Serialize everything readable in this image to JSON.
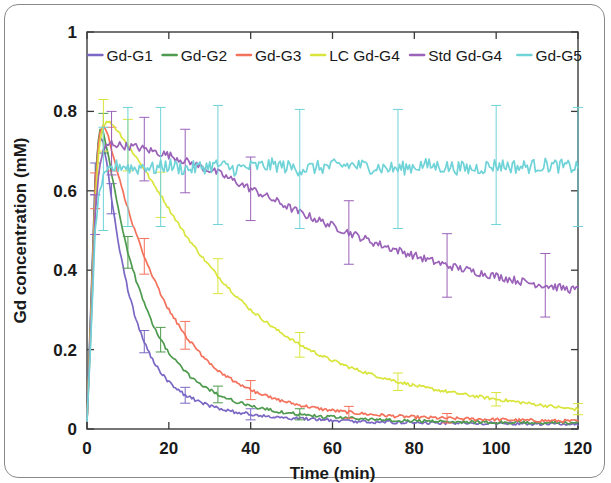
{
  "figure": {
    "background_color": "#ffffff",
    "border_color": "#8a8a8a"
  },
  "axes": {
    "x_label": "Time (min)",
    "y_label": "Gd concentration (mM)",
    "x_ticks": [
      "0",
      "20",
      "40",
      "60",
      "80",
      "100",
      "120"
    ],
    "y_ticks": [
      "0",
      "0.2",
      "0.4",
      "0.6",
      "0.8",
      "1"
    ],
    "x_lim": [
      0,
      120
    ],
    "y_lim": [
      0,
      1
    ],
    "tick_direction": "in",
    "box": true
  },
  "legend": {
    "position": "top-inside",
    "orientation": "horizontal",
    "entries": [
      {
        "label": "Gd-G1",
        "color": "#7b68c4"
      },
      {
        "label": "Gd-G2",
        "color": "#4e9a4e"
      },
      {
        "label": "Gd-G3",
        "color": "#f4715c"
      },
      {
        "label": "LC Gd-G4",
        "color": "#d9e53d"
      },
      {
        "label": "Std Gd-G4",
        "color": "#9a62b8"
      },
      {
        "label": "Gd-G5",
        "color": "#6fd3d8"
      }
    ]
  },
  "chart_data": {
    "type": "line",
    "title": "",
    "xlabel": "Time (min)",
    "ylabel": "Gd concentration (mM)",
    "xlim": [
      0,
      120
    ],
    "ylim": [
      0,
      1
    ],
    "grid": false,
    "legend_position": "top-inside",
    "error_bars": true,
    "x_unit": "min",
    "y_unit": "mM",
    "series": [
      {
        "name": "Gd-G1",
        "color": "#7b68c4",
        "peak_value": 0.74,
        "peak_time": 3,
        "final_value": 0.012,
        "decay_halflife_min": 5.5,
        "error_bar_magnitude": 0.035,
        "x": [
          0,
          1,
          2,
          3,
          4,
          5,
          6,
          8,
          10,
          12,
          14,
          16,
          18,
          20,
          24,
          28,
          32,
          36,
          40,
          46,
          52,
          58,
          64,
          70,
          76,
          82,
          88,
          94,
          100,
          106,
          112,
          118,
          120
        ],
        "y": [
          0.02,
          0.33,
          0.63,
          0.74,
          0.72,
          0.66,
          0.58,
          0.45,
          0.35,
          0.275,
          0.22,
          0.175,
          0.143,
          0.118,
          0.085,
          0.066,
          0.052,
          0.043,
          0.037,
          0.03,
          0.026,
          0.023,
          0.02,
          0.018,
          0.017,
          0.016,
          0.015,
          0.014,
          0.014,
          0.013,
          0.013,
          0.012,
          0.012
        ],
        "yerr": [
          0.01,
          0.03,
          0.04,
          0.045,
          0.045,
          0.04,
          0.038,
          0.035,
          0.032,
          0.03,
          0.028,
          0.026,
          0.024,
          0.022,
          0.02,
          0.018,
          0.016,
          0.015,
          0.014,
          0.013,
          0.012,
          0.011,
          0.01,
          0.01,
          0.009,
          0.009,
          0.008,
          0.008,
          0.008,
          0.007,
          0.007,
          0.007,
          0.007
        ]
      },
      {
        "name": "Gd-G2",
        "color": "#4e9a4e",
        "peak_value": 0.755,
        "peak_time": 3.5,
        "final_value": 0.015,
        "decay_halflife_min": 7.5,
        "error_bar_magnitude": 0.04,
        "x": [
          0,
          1,
          2,
          3,
          4,
          5,
          6,
          8,
          10,
          12,
          14,
          16,
          18,
          20,
          24,
          28,
          32,
          36,
          40,
          46,
          52,
          58,
          64,
          70,
          76,
          82,
          88,
          94,
          100,
          106,
          112,
          118,
          120
        ],
        "y": [
          0.02,
          0.31,
          0.62,
          0.755,
          0.745,
          0.7,
          0.645,
          0.535,
          0.445,
          0.375,
          0.315,
          0.265,
          0.225,
          0.192,
          0.143,
          0.11,
          0.087,
          0.07,
          0.058,
          0.045,
          0.037,
          0.031,
          0.027,
          0.024,
          0.022,
          0.02,
          0.019,
          0.018,
          0.017,
          0.016,
          0.016,
          0.015,
          0.015
        ],
        "yerr": [
          0.01,
          0.03,
          0.045,
          0.05,
          0.05,
          0.048,
          0.045,
          0.042,
          0.04,
          0.038,
          0.035,
          0.033,
          0.031,
          0.029,
          0.026,
          0.023,
          0.021,
          0.019,
          0.017,
          0.016,
          0.014,
          0.013,
          0.012,
          0.011,
          0.011,
          0.01,
          0.01,
          0.009,
          0.009,
          0.009,
          0.008,
          0.008,
          0.008
        ]
      },
      {
        "name": "Gd-G3",
        "color": "#f4715c",
        "peak_value": 0.765,
        "peak_time": 4,
        "final_value": 0.02,
        "decay_halflife_min": 11,
        "error_bar_magnitude": 0.045,
        "x": [
          0,
          1,
          2,
          3,
          4,
          5,
          6,
          8,
          10,
          12,
          14,
          16,
          18,
          20,
          24,
          28,
          32,
          36,
          40,
          46,
          52,
          58,
          64,
          70,
          76,
          82,
          88,
          94,
          100,
          106,
          112,
          118,
          120
        ],
        "y": [
          0.02,
          0.29,
          0.6,
          0.745,
          0.765,
          0.745,
          0.705,
          0.625,
          0.555,
          0.49,
          0.435,
          0.385,
          0.34,
          0.3,
          0.236,
          0.186,
          0.148,
          0.12,
          0.098,
          0.075,
          0.06,
          0.049,
          0.042,
          0.036,
          0.032,
          0.029,
          0.027,
          0.025,
          0.024,
          0.022,
          0.021,
          0.02,
          0.02
        ],
        "yerr": [
          0.01,
          0.03,
          0.045,
          0.055,
          0.058,
          0.058,
          0.055,
          0.052,
          0.05,
          0.048,
          0.045,
          0.043,
          0.041,
          0.039,
          0.035,
          0.032,
          0.029,
          0.026,
          0.024,
          0.021,
          0.019,
          0.017,
          0.015,
          0.014,
          0.013,
          0.012,
          0.012,
          0.011,
          0.011,
          0.01,
          0.01,
          0.01,
          0.01
        ]
      },
      {
        "name": "LC Gd-G4",
        "color": "#d9e53d",
        "peak_value": 0.775,
        "peak_time": 5,
        "final_value": 0.05,
        "decay_halflife_min": 26,
        "error_bar_magnitude": 0.06,
        "x": [
          0,
          1,
          2,
          3,
          4,
          5,
          6,
          8,
          10,
          12,
          14,
          16,
          18,
          20,
          24,
          28,
          32,
          36,
          40,
          46,
          52,
          58,
          64,
          70,
          76,
          82,
          88,
          94,
          100,
          106,
          112,
          118,
          120
        ],
        "y": [
          0.02,
          0.27,
          0.57,
          0.72,
          0.765,
          0.775,
          0.77,
          0.745,
          0.715,
          0.685,
          0.655,
          0.62,
          0.59,
          0.555,
          0.49,
          0.435,
          0.385,
          0.34,
          0.3,
          0.252,
          0.212,
          0.181,
          0.156,
          0.136,
          0.119,
          0.105,
          0.094,
          0.084,
          0.075,
          0.067,
          0.059,
          0.051,
          0.05
        ],
        "yerr": [
          0.01,
          0.03,
          0.05,
          0.06,
          0.065,
          0.068,
          0.068,
          0.067,
          0.065,
          0.063,
          0.061,
          0.059,
          0.057,
          0.055,
          0.051,
          0.047,
          0.044,
          0.041,
          0.038,
          0.034,
          0.031,
          0.028,
          0.026,
          0.024,
          0.022,
          0.021,
          0.019,
          0.018,
          0.017,
          0.016,
          0.015,
          0.014,
          0.014
        ]
      },
      {
        "name": "Std Gd-G4",
        "color": "#9a62b8",
        "peak_value": 0.72,
        "peak_time": 6,
        "final_value": 0.35,
        "decay_halflife_min": 110,
        "error_bar_magnitude": 0.08,
        "x": [
          0,
          1,
          2,
          3,
          4,
          5,
          6,
          8,
          10,
          12,
          14,
          16,
          18,
          20,
          24,
          28,
          32,
          36,
          40,
          46,
          52,
          58,
          64,
          70,
          76,
          82,
          88,
          94,
          100,
          106,
          112,
          118,
          120
        ],
        "y": [
          0.02,
          0.26,
          0.54,
          0.66,
          0.7,
          0.715,
          0.72,
          0.715,
          0.712,
          0.71,
          0.705,
          0.7,
          0.695,
          0.69,
          0.675,
          0.66,
          0.645,
          0.625,
          0.605,
          0.575,
          0.545,
          0.52,
          0.495,
          0.47,
          0.45,
          0.43,
          0.412,
          0.398,
          0.385,
          0.372,
          0.362,
          0.352,
          0.35
        ],
        "yerr": [
          0.01,
          0.03,
          0.05,
          0.06,
          0.07,
          0.075,
          0.08,
          0.08,
          0.08,
          0.08,
          0.08,
          0.08,
          0.08,
          0.08,
          0.08,
          0.08,
          0.08,
          0.08,
          0.08,
          0.08,
          0.08,
          0.08,
          0.08,
          0.08,
          0.08,
          0.08,
          0.08,
          0.08,
          0.08,
          0.08,
          0.08,
          0.08,
          0.08
        ]
      },
      {
        "name": "Gd-G5",
        "color": "#6fd3d8",
        "peak_value": 0.67,
        "peak_time": 8,
        "final_value": 0.66,
        "decay_halflife_min": null,
        "error_bar_magnitude": 0.15,
        "x": [
          0,
          1,
          2,
          3,
          4,
          5,
          6,
          8,
          10,
          12,
          14,
          16,
          18,
          20,
          24,
          28,
          32,
          36,
          40,
          46,
          52,
          58,
          64,
          70,
          76,
          82,
          88,
          94,
          100,
          106,
          112,
          118,
          120
        ],
        "y": [
          0.02,
          0.24,
          0.5,
          0.6,
          0.63,
          0.645,
          0.655,
          0.665,
          0.66,
          0.655,
          0.665,
          0.655,
          0.66,
          0.665,
          0.655,
          0.66,
          0.665,
          0.655,
          0.66,
          0.665,
          0.655,
          0.66,
          0.665,
          0.66,
          0.655,
          0.665,
          0.66,
          0.655,
          0.665,
          0.66,
          0.665,
          0.66,
          0.66
        ],
        "yerr": [
          0.01,
          0.04,
          0.08,
          0.11,
          0.13,
          0.14,
          0.145,
          0.15,
          0.15,
          0.15,
          0.15,
          0.15,
          0.15,
          0.15,
          0.15,
          0.15,
          0.15,
          0.15,
          0.15,
          0.15,
          0.15,
          0.15,
          0.15,
          0.15,
          0.15,
          0.15,
          0.15,
          0.15,
          0.15,
          0.15,
          0.15,
          0.15,
          0.15
        ]
      }
    ]
  }
}
